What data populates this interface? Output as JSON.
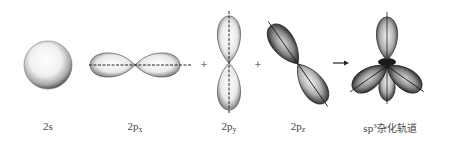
{
  "diagram": {
    "type": "orbital-hybridization",
    "colors": {
      "background": "#ffffff",
      "ink": "#222222",
      "label": "#444444"
    },
    "orbitals": [
      {
        "id": "2s",
        "label": "2s",
        "label_main": "2s",
        "label_sub": "",
        "shape": "sphere"
      },
      {
        "id": "2px",
        "label": "2px",
        "label_main": "2p",
        "label_sub": "x",
        "shape": "dumbbell-horizontal"
      },
      {
        "id": "2py",
        "label": "2py",
        "label_main": "2p",
        "label_sub": "y",
        "shape": "dumbbell-vertical"
      },
      {
        "id": "2pz",
        "label": "2pz",
        "label_main": "2p",
        "label_sub": "z",
        "shape": "dumbbell-diagonal"
      },
      {
        "id": "sp3",
        "label": "sp3杂化轨道",
        "label_main": "sp",
        "label_sup": "3",
        "label_rest": "杂化轨道",
        "shape": "tetrahedral-lobes"
      }
    ],
    "operators": [
      {
        "symbol": "+",
        "between": [
          "2px",
          "2py"
        ]
      },
      {
        "symbol": "+",
        "between": [
          "2py",
          "2pz"
        ]
      },
      {
        "symbol": "→",
        "between": [
          "2pz",
          "sp3"
        ]
      }
    ]
  }
}
